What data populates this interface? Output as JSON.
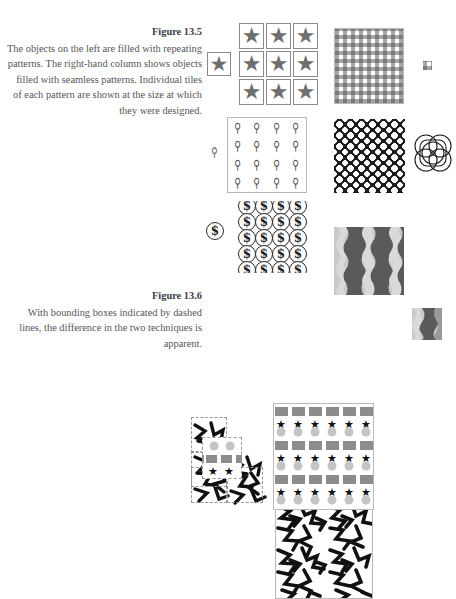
{
  "page": {
    "width": 456,
    "height": 521,
    "background": "#ffffff",
    "text_color": "#53565a",
    "label_color": "#3d4043"
  },
  "figures": [
    {
      "id": "figure-13-5",
      "label": "Figure 13.5",
      "caption": "The objects on the left are filled with repeating patterns. The right-hand column shows objects filled with seamless patterns. Individual tiles of each pattern are shown at the size at which they were designed."
    },
    {
      "id": "figure-13-6",
      "label": "Figure 13.6",
      "caption": "With bounding boxes indicated by dashed lines, the difference in the two techniques is apparent."
    }
  ],
  "samples": {
    "star": {
      "name": "star-tile-pattern",
      "glyph": "★",
      "tile_color": "#6e6e6e",
      "border_color": "#8a8a8a",
      "grid_rows": 3,
      "grid_cols": 3
    },
    "gingham": {
      "name": "gingham-check-pattern",
      "color": "#5a5a5a",
      "cell_px": 8
    },
    "figure_glyph": {
      "name": "figure-glyph-pattern",
      "glyph": "⚲",
      "color": "#4a4a4a",
      "grid_rows": 4,
      "grid_cols": 4
    },
    "lattice": {
      "name": "interlocking-circles-pattern",
      "background": "#1c1c1c",
      "dot_color": "#ffffff",
      "cell_px": 11
    },
    "coin": {
      "name": "dollar-coin-pattern",
      "glyph": "$",
      "stroke": "#2b2b2b",
      "grid_rows": 4,
      "grid_cols": 4
    },
    "wavy": {
      "name": "wavy-stripe-pattern",
      "colors": [
        "#c9c9c9",
        "#9a9a9a",
        "#5a5a5a",
        "#d9d9d9"
      ],
      "stripe_count": 4
    },
    "scribble": {
      "name": "scribble-pattern",
      "ink": "#111111",
      "bounding_box_style": "dashed",
      "bounding_box_color": "#9a9a9a"
    },
    "shapes": {
      "name": "star-square-circle-pattern",
      "square_color": "#8c8c8c",
      "star_color": "#111111",
      "circle_color": "#c4c4c4",
      "row_pattern": [
        "squares",
        "stars-and-circles"
      ]
    }
  }
}
